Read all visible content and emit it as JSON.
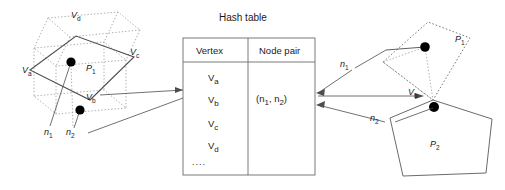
{
  "figure": {
    "title": "Hash table"
  },
  "table": {
    "headers": [
      "Vertex",
      "Node pair"
    ],
    "vertex_rows": [
      "V",
      "V",
      "V",
      "V"
    ],
    "vertex_labels": [
      {
        "base": "V",
        "sub": "a"
      },
      {
        "base": "V",
        "sub": "b"
      },
      {
        "base": "V",
        "sub": "c"
      },
      {
        "base": "V",
        "sub": "d"
      }
    ],
    "ellipsis": "....",
    "node_pair_value": {
      "open": "(",
      "n1": "n",
      "sub1": "1",
      "sep": ", ",
      "n2": "n",
      "sub2": "2",
      "close": ")"
    },
    "node_pair_text": "(n1, n2)"
  },
  "left_diagram": {
    "name": "cube-with-patch",
    "patch_label": {
      "base": "P",
      "sub": "1"
    },
    "vertex_a": {
      "base": "V",
      "sub": "a"
    },
    "vertex_b": {
      "base": "V",
      "sub": "b"
    },
    "vertex_c": {
      "base": "V",
      "sub": "c"
    },
    "vertex_d": {
      "base": "V",
      "sub": "d"
    },
    "node_1": {
      "base": "n",
      "sub": "1"
    },
    "node_2": {
      "base": "n",
      "sub": "2"
    }
  },
  "right_diagram": {
    "name": "patch-pair",
    "patch_1_label": {
      "base": "P",
      "sub": "1"
    },
    "patch_2_label": {
      "base": "P",
      "sub": "2"
    },
    "vertex_b": {
      "base": "V",
      "sub": "b"
    },
    "node_1": {
      "base": "n",
      "sub": "1"
    },
    "node_2": {
      "base": "n",
      "sub": "2"
    }
  },
  "colors": {
    "stroke": "#4d4d4d",
    "stroke_dotted": "#9a9a9a",
    "node_fill": "#000000",
    "text": "#1a1a1a",
    "background": "#ffffff"
  }
}
